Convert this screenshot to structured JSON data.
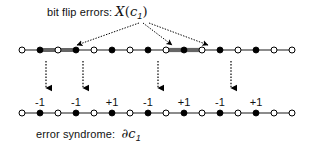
{
  "figure": {
    "width": 312,
    "height": 146,
    "background": "#ffffff",
    "title": "bit flip errors:",
    "title_math_main": "X",
    "title_math_open": "(",
    "title_math_var": "c",
    "title_math_sub": "1",
    "title_math_close": ")",
    "caption": "error syndrome:",
    "caption_math_boundary": "∂",
    "caption_math_var": "c",
    "caption_math_sub": "1"
  },
  "colors": {
    "line": "#1a1a1a",
    "thick_segment": "#666666",
    "node_filled": "#000000",
    "node_open_fill": "#ffffff",
    "node_stroke": "#000000",
    "text": "#111111",
    "arrow": "#000000"
  },
  "top_chain": {
    "name": "error-chain-lattice",
    "y": 50,
    "x_start": 22,
    "x_end": 292,
    "node_spacing": 18.0,
    "nodes": [
      {
        "index": 0,
        "x": 22,
        "type": "open"
      },
      {
        "index": 1,
        "x": 40,
        "type": "filled"
      },
      {
        "index": 2,
        "x": 58,
        "type": "open"
      },
      {
        "index": 3,
        "x": 76,
        "type": "filled"
      },
      {
        "index": 4,
        "x": 94,
        "type": "open"
      },
      {
        "index": 5,
        "x": 112,
        "type": "filled"
      },
      {
        "index": 6,
        "x": 130,
        "type": "open"
      },
      {
        "index": 7,
        "x": 148,
        "type": "filled"
      },
      {
        "index": 8,
        "x": 166,
        "type": "open"
      },
      {
        "index": 9,
        "x": 184,
        "type": "filled"
      },
      {
        "index": 10,
        "x": 202,
        "type": "open"
      },
      {
        "index": 11,
        "x": 220,
        "type": "filled"
      },
      {
        "index": 12,
        "x": 238,
        "type": "open"
      },
      {
        "index": 13,
        "x": 256,
        "type": "filled"
      },
      {
        "index": 14,
        "x": 274,
        "type": "open"
      },
      {
        "index": 15,
        "x": 292,
        "type": "open"
      }
    ],
    "thick_segments": [
      {
        "x1": 40,
        "x2": 76,
        "label": "flipped-edge-1"
      },
      {
        "x1": 166,
        "x2": 184,
        "label": "flipped-edge-2"
      },
      {
        "x1": 184,
        "x2": 202,
        "label": "flipped-edge-3"
      }
    ]
  },
  "bottom_chain": {
    "name": "syndrome-lattice",
    "y": 113,
    "x_start": 22,
    "x_end": 292,
    "node_spacing": 18.0,
    "nodes": [
      {
        "index": 0,
        "x": 22,
        "type": "open"
      },
      {
        "index": 1,
        "x": 40,
        "type": "filled"
      },
      {
        "index": 2,
        "x": 58,
        "type": "open"
      },
      {
        "index": 3,
        "x": 76,
        "type": "filled"
      },
      {
        "index": 4,
        "x": 94,
        "type": "open"
      },
      {
        "index": 5,
        "x": 112,
        "type": "filled"
      },
      {
        "index": 6,
        "x": 130,
        "type": "open"
      },
      {
        "index": 7,
        "x": 148,
        "type": "filled"
      },
      {
        "index": 8,
        "x": 166,
        "type": "open"
      },
      {
        "index": 9,
        "x": 184,
        "type": "filled"
      },
      {
        "index": 10,
        "x": 202,
        "type": "open"
      },
      {
        "index": 11,
        "x": 220,
        "type": "filled"
      },
      {
        "index": 12,
        "x": 238,
        "type": "open"
      },
      {
        "index": 13,
        "x": 256,
        "type": "filled"
      },
      {
        "index": 14,
        "x": 274,
        "type": "open"
      },
      {
        "index": 15,
        "x": 292,
        "type": "open"
      }
    ],
    "sign_labels": [
      {
        "x": 40,
        "y": 96,
        "value": "-1"
      },
      {
        "x": 76,
        "y": 96,
        "value": "-1"
      },
      {
        "x": 112,
        "y": 96,
        "value": "+1"
      },
      {
        "x": 148,
        "y": 96,
        "value": "-1"
      },
      {
        "x": 184,
        "y": 96,
        "value": "+1"
      },
      {
        "x": 220,
        "y": 96,
        "value": "-1"
      },
      {
        "x": 256,
        "y": 96,
        "value": "+1"
      }
    ]
  },
  "fan_arrows": [
    {
      "name": "fan-arrow-left",
      "x1": 139,
      "y1": 23,
      "x2": 77,
      "y2": 45
    },
    {
      "name": "fan-arrow-mid",
      "x1": 143,
      "y1": 23,
      "x2": 172,
      "y2": 45
    },
    {
      "name": "fan-arrow-right",
      "x1": 149,
      "y1": 23,
      "x2": 208,
      "y2": 45
    }
  ],
  "down_arrows": [
    {
      "name": "down-arrow-1",
      "x": 46,
      "y1": 61,
      "y2": 88
    },
    {
      "name": "down-arrow-2",
      "x": 83,
      "y1": 61,
      "y2": 88
    },
    {
      "name": "down-arrow-3",
      "x": 158,
      "y1": 61,
      "y2": 88
    },
    {
      "name": "down-arrow-4",
      "x": 231,
      "y1": 61,
      "y2": 88
    }
  ]
}
